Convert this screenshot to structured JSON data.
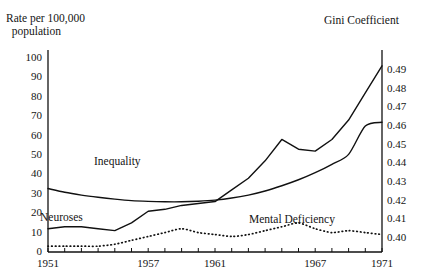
{
  "chart_data": {
    "type": "line",
    "title": "",
    "xlabel": "",
    "ylabel": "Rate per 100,000 population",
    "y2label": "Gini Coefficient",
    "grid": false,
    "legend_position": "inline-annotations",
    "x": [
      1951,
      1952,
      1953,
      1954,
      1955,
      1956,
      1957,
      1958,
      1959,
      1960,
      1961,
      1962,
      1963,
      1964,
      1965,
      1966,
      1967,
      1968,
      1969,
      1970,
      1971
    ],
    "xlim": [
      1951,
      1971
    ],
    "ylim": [
      0,
      100
    ],
    "y2lim": [
      0.4,
      0.49
    ],
    "xticks": [
      1951,
      1952,
      1953,
      1954,
      1955,
      1956,
      1957,
      1958,
      1959,
      1960,
      1961,
      1962,
      1963,
      1964,
      1965,
      1966,
      1967,
      1968,
      1969,
      1970,
      1971
    ],
    "xtick_labels": [
      "1951",
      "",
      "",
      "",
      "",
      "",
      "1957",
      "",
      "",
      "",
      "1961",
      "",
      "",
      "",
      "",
      "",
      "1967",
      "",
      "",
      "",
      "1971"
    ],
    "yticks_left": [
      0,
      10,
      20,
      30,
      40,
      50,
      60,
      70,
      80,
      90,
      100
    ],
    "yticks_right": [
      0.4,
      0.41,
      0.42,
      0.43,
      0.44,
      0.45,
      0.46,
      0.47,
      0.48,
      0.49
    ],
    "series": [
      {
        "name": "Neuroses",
        "axis": "left",
        "style": "solid",
        "color": "#111111",
        "values": [
          12,
          13,
          13,
          12,
          11,
          15,
          21,
          22,
          24,
          25,
          26,
          32,
          38,
          47,
          58,
          53,
          52,
          58,
          68,
          82,
          96
        ]
      },
      {
        "name": "Mental Deficiency",
        "axis": "left",
        "style": "dotted",
        "color": "#111111",
        "values": [
          3,
          3,
          3,
          3,
          4,
          6,
          8,
          10,
          12,
          10,
          9,
          8,
          9,
          11,
          13,
          15,
          12,
          10,
          11,
          10,
          9
        ]
      },
      {
        "name": "Inequality",
        "axis": "right",
        "style": "solid",
        "color": "#111111",
        "values": [
          0.4265,
          0.4245,
          0.423,
          0.4218,
          0.4208,
          0.42,
          0.4196,
          0.4194,
          0.4194,
          0.4197,
          0.4203,
          0.4214,
          0.423,
          0.4252,
          0.428,
          0.4312,
          0.435,
          0.4395,
          0.4448,
          0.46,
          0.462
        ]
      }
    ],
    "annotations": [
      {
        "text": "Inequality",
        "x": 1955.4,
        "y_px_hint": "above-inequality-curve"
      },
      {
        "text": "Neuroses",
        "x": 1951.6,
        "y_px_hint": "left-of-neuroses-curve"
      },
      {
        "text": "Mental Deficiency",
        "x": 1963.5,
        "y_px_hint": "above-dotted-curve"
      }
    ]
  },
  "axes": {
    "left_title": "Rate per 100,000\n  population",
    "right_title": "Gini Coefficient",
    "left_ticks": [
      "100",
      "90",
      "80",
      "70",
      "60",
      "50",
      "40",
      "30",
      "20",
      "10",
      "0"
    ],
    "right_ticks": [
      "0.49",
      "0.48",
      "0.47",
      "0.46",
      "0.45",
      "0.44",
      "0.43",
      "0.42",
      "0.41",
      "0.40"
    ],
    "x_ticks": [
      "1951",
      "1957",
      "1961",
      "1967",
      "1971"
    ]
  },
  "labels": {
    "inequality": "Inequality",
    "neuroses": "Neuroses",
    "mental_deficiency": "Mental Deficiency"
  }
}
